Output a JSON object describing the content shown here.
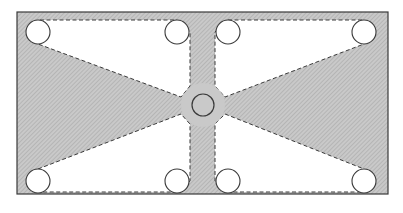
{
  "diagram": {
    "type": "plate-with-holes",
    "colors": {
      "background": "#ffffff",
      "plate_fill": "#c9c9c9",
      "hatch": "#a8a8a8",
      "cutout_fill": "#ffffff",
      "stroke": "#3a3a3a"
    },
    "plate": {
      "x": 17,
      "y": 12,
      "width": 371,
      "height": 182
    },
    "center_hole": {
      "cx": 203,
      "cy": 105,
      "r": 11
    },
    "holes": [
      {
        "cx": 38,
        "cy": 32,
        "r": 12
      },
      {
        "cx": 177,
        "cy": 32,
        "r": 12
      },
      {
        "cx": 228,
        "cy": 32,
        "r": 12
      },
      {
        "cx": 364,
        "cy": 32,
        "r": 12
      },
      {
        "cx": 38,
        "cy": 181,
        "r": 12
      },
      {
        "cx": 177,
        "cy": 181,
        "r": 12
      },
      {
        "cx": 228,
        "cy": 181,
        "r": 12
      },
      {
        "cx": 364,
        "cy": 181,
        "r": 12
      }
    ],
    "cutouts": [
      {
        "name": "upper-left",
        "points": "40,20 177,20 190,32 190,86 181,97 38,44"
      },
      {
        "name": "upper-right",
        "points": "228,20 364,20 364,44 225,97 215,86 215,32"
      },
      {
        "name": "lower-left",
        "points": "38,169 181,114 190,124 190,181 177,192 40,192"
      },
      {
        "name": "lower-right",
        "points": "225,114 364,169 364,192 228,192 215,181 215,124"
      }
    ]
  }
}
